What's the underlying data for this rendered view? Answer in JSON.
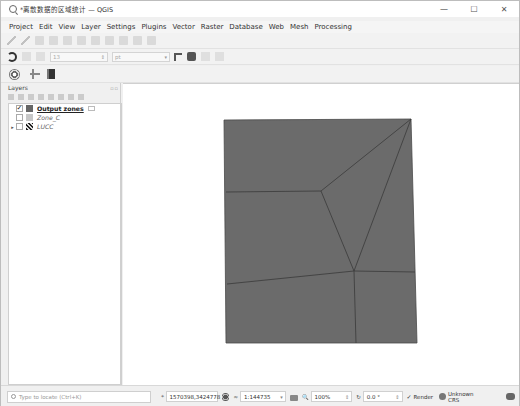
{
  "window": {
    "title": "*离散数据的区域统计 — QGIS",
    "controls": {
      "minimize": "—",
      "maximize": "☐",
      "close": "✕"
    }
  },
  "menubar": {
    "items": [
      "Project",
      "Edit",
      "View",
      "Layer",
      "Settings",
      "Plugins",
      "Vector",
      "Raster",
      "Database",
      "Web",
      "Mesh",
      "Processing"
    ]
  },
  "toolbar2": {
    "size_value": "13",
    "unit_value": "pt"
  },
  "layers_panel": {
    "title": "Layers",
    "dock_icons": "▫▫",
    "layers": [
      {
        "name": "Output zones",
        "checked": true,
        "symbol": "polygon-dark",
        "expander": "",
        "selected": true
      },
      {
        "name": "Zone_C",
        "checked": false,
        "symbol": "polygon-light",
        "expander": ""
      },
      {
        "name": "LUCC",
        "checked": false,
        "symbol": "raster",
        "expander": "▸"
      }
    ]
  },
  "map": {
    "fill_color": "#6b6b6b",
    "stroke_color": "#3a3a3a",
    "background": "#ffffff"
  },
  "statusbar": {
    "locator_placeholder": "Type to locate (Ctrl+K)",
    "coordinate_label": "⌖",
    "coordinate": "1570398,3424778",
    "scale_label": "≈",
    "scale": "1:144735",
    "magnifier_label": "🔍",
    "magnifier": "100%",
    "rotation_label": "↻",
    "rotation": "0.0 °",
    "render_label": "Render",
    "render_checked": true,
    "crs_label": "Unknown CRS"
  }
}
